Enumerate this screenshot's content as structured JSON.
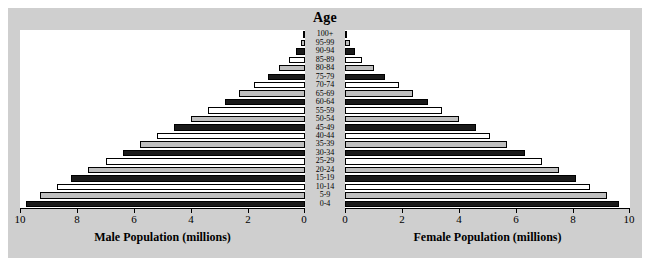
{
  "chart_data": {
    "type": "bar",
    "title": "Age",
    "subtitle": "",
    "orientation": "horizontal",
    "layout": "population-pyramid",
    "grid": false,
    "legend": "none",
    "categories": [
      "0-4",
      "5-9",
      "10-14",
      "15-19",
      "20-24",
      "25-29",
      "30-34",
      "35-39",
      "40-44",
      "45-49",
      "50-54",
      "55-59",
      "60-64",
      "65-69",
      "70-74",
      "75-79",
      "80-84",
      "85-89",
      "90-94",
      "95-99",
      "100+"
    ],
    "xlabel_left": "Male Population (millions)",
    "xlabel_right": "Female Population (millions)",
    "ylabel": "Age",
    "xlim_left": [
      10,
      0
    ],
    "xlim_right": [
      0,
      10
    ],
    "xticks_left": [
      "10",
      "8",
      "6",
      "4",
      "2",
      "0"
    ],
    "xticks_right": [
      "0",
      "2",
      "4",
      "6",
      "8",
      "10"
    ],
    "xtick_values": [
      0,
      2,
      4,
      6,
      8,
      10
    ],
    "series": [
      {
        "name": "Male Population (millions)",
        "side": "left",
        "values": [
          9.8,
          9.3,
          8.7,
          8.2,
          7.6,
          7.0,
          6.4,
          5.8,
          5.2,
          4.6,
          4.0,
          3.4,
          2.8,
          2.3,
          1.8,
          1.3,
          0.9,
          0.55,
          0.3,
          0.15,
          0.05
        ]
      },
      {
        "name": "Female Population (millions)",
        "side": "right",
        "values": [
          9.6,
          9.2,
          8.6,
          8.1,
          7.5,
          6.9,
          6.3,
          5.7,
          5.1,
          4.6,
          4.0,
          3.4,
          2.9,
          2.4,
          1.9,
          1.4,
          1.0,
          0.6,
          0.35,
          0.18,
          0.06
        ]
      }
    ],
    "bar_fills": [
      "dark",
      "gray",
      "white",
      "dark",
      "gray",
      "white",
      "dark",
      "gray",
      "white",
      "dark",
      "gray",
      "white",
      "dark",
      "gray",
      "white",
      "dark",
      "gray",
      "white",
      "dark",
      "gray",
      "white"
    ],
    "colors": {
      "dark": "#1a1a1a",
      "gray": "#bfbfbf",
      "white": "#ffffff",
      "outline": "#000000",
      "figure_background": "#cfcfcf",
      "plot_background": "#ffffff"
    }
  }
}
